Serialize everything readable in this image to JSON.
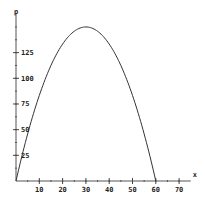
{
  "chart_data": {
    "type": "line",
    "title": "",
    "xlabel": "x",
    "ylabel": "p",
    "xlim": [
      0,
      75
    ],
    "ylim": [
      0,
      155
    ],
    "grid": false,
    "legend": null,
    "x_ticks": [
      10,
      20,
      30,
      40,
      50,
      60,
      70
    ],
    "x_minor_step": 5,
    "y_ticks": [
      25,
      50,
      75,
      100,
      125
    ],
    "y_minor_step": 12.5,
    "series": [
      {
        "name": "p(x)",
        "color": "#333333",
        "x": [
          0,
          5,
          10,
          15,
          20,
          25,
          30,
          35,
          40,
          45,
          50,
          55,
          60
        ],
        "values": [
          0,
          45.8,
          83.3,
          112.5,
          133.3,
          145.8,
          150,
          145.8,
          133.3,
          112.5,
          83.3,
          45.8,
          0
        ]
      }
    ]
  }
}
